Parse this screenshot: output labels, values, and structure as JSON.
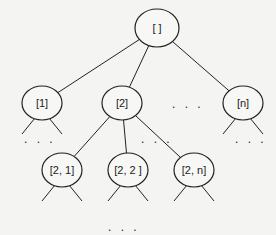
{
  "diagram": {
    "type": "tree",
    "root": {
      "id": "root",
      "label": "[ ]"
    },
    "level1": [
      {
        "id": "n1",
        "label": "[1]"
      },
      {
        "id": "n2",
        "label": "[2]"
      },
      {
        "id": "nn",
        "label": "[n]"
      }
    ],
    "level1_ellipsis": ". . .",
    "level2": [
      {
        "id": "n21",
        "label": "[2, 1]"
      },
      {
        "id": "n22",
        "label": "[2, 2 ]"
      },
      {
        "id": "n2n",
        "label": "[2, n]"
      }
    ],
    "level2_ellipsis": ". . .",
    "subtree_ellipsis": ". . .",
    "bottom_ellipsis": ".  .  .",
    "edges": [
      [
        "root",
        "n1"
      ],
      [
        "root",
        "n2"
      ],
      [
        "root",
        "nn"
      ],
      [
        "n2",
        "n21"
      ],
      [
        "n2",
        "n22"
      ],
      [
        "n2",
        "n2n"
      ]
    ]
  }
}
